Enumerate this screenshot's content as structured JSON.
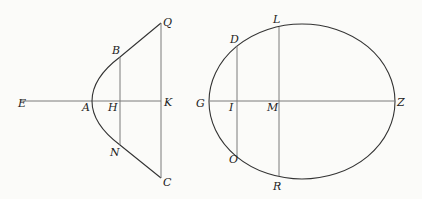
{
  "figure": {
    "left": {
      "type": "parabola",
      "labels": {
        "E": {
          "text": "E",
          "x": 18,
          "y": 107
        },
        "A": {
          "text": "A",
          "x": 82,
          "y": 111
        },
        "H": {
          "text": "H",
          "x": 108,
          "y": 111
        },
        "K": {
          "text": "K",
          "x": 164,
          "y": 106
        },
        "B": {
          "text": "B",
          "x": 112,
          "y": 54
        },
        "Q": {
          "text": "Q",
          "x": 163,
          "y": 26
        },
        "N": {
          "text": "N",
          "x": 110,
          "y": 156
        },
        "C": {
          "text": "C",
          "x": 163,
          "y": 186
        }
      }
    },
    "right": {
      "type": "ellipse",
      "labels": {
        "G": {
          "text": "G",
          "x": 196,
          "y": 107
        },
        "I": {
          "text": "I",
          "x": 229,
          "y": 111
        },
        "M": {
          "text": "M",
          "x": 267,
          "y": 111
        },
        "Z": {
          "text": "Z",
          "x": 397,
          "y": 106
        },
        "D": {
          "text": "D",
          "x": 230,
          "y": 43
        },
        "L": {
          "text": "L",
          "x": 273,
          "y": 23
        },
        "O": {
          "text": "O",
          "x": 229,
          "y": 163
        },
        "R": {
          "text": "R",
          "x": 273,
          "y": 190
        }
      }
    }
  }
}
